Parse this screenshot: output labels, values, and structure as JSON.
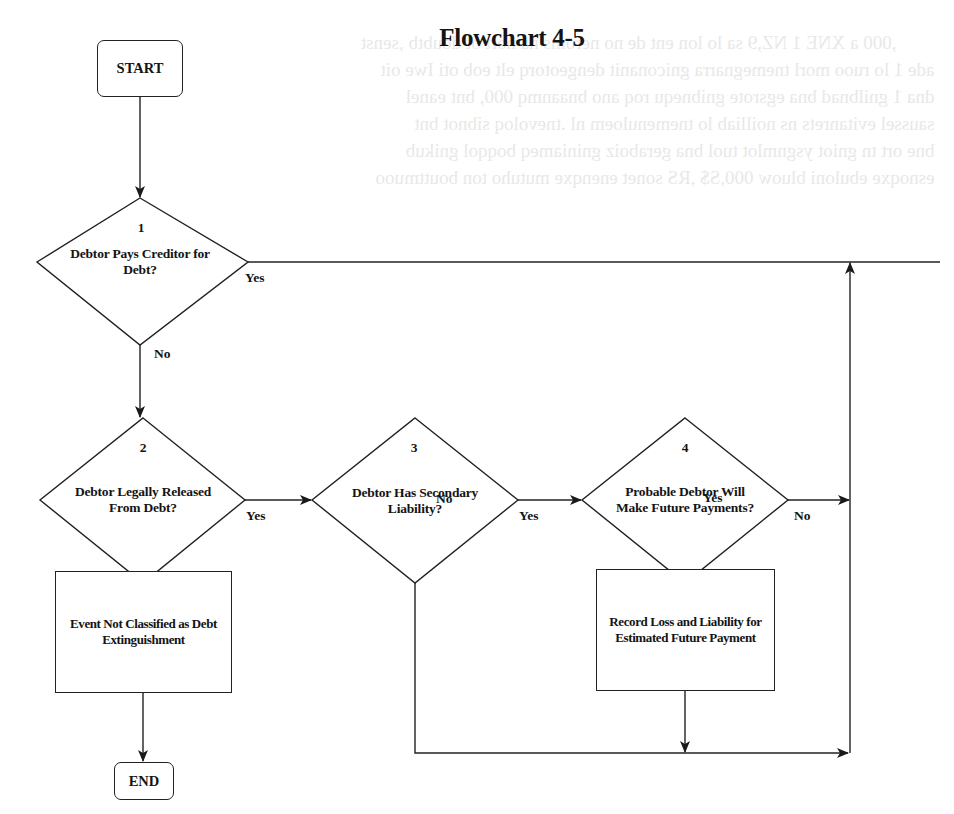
{
  "title": "Flowchart 4-5",
  "start": {
    "label": "START"
  },
  "end": {
    "label": "END"
  },
  "decisions": [
    {
      "number": "1",
      "line1": "Debtor Pays Creditor for",
      "line2": "Debt?",
      "yes_label": "Yes",
      "no_label": "No"
    },
    {
      "number": "2",
      "line1": "Debtor Legally Released",
      "line2": "From Debt?",
      "yes_label": "Yes",
      "no_label": "No"
    },
    {
      "number": "3",
      "line1": "Debtor Has Secondary",
      "line2": "Liability?",
      "yes_label": "Yes",
      "no_label": "No"
    },
    {
      "number": "4",
      "line1": "Probable Debtor Will",
      "line2": "Make Future Payments?",
      "yes_label": "Yes",
      "no_label": "No"
    }
  ],
  "processes": [
    {
      "line1": "Event Not Classified as Debt",
      "line2": "Extinguishment"
    },
    {
      "line1": "Record Loss and Liability for",
      "line2": "Estimated Future Payment"
    }
  ],
  "colors": {
    "ink": "#222222",
    "background": "#ffffff",
    "bleed_through": "#d6d6d6"
  }
}
